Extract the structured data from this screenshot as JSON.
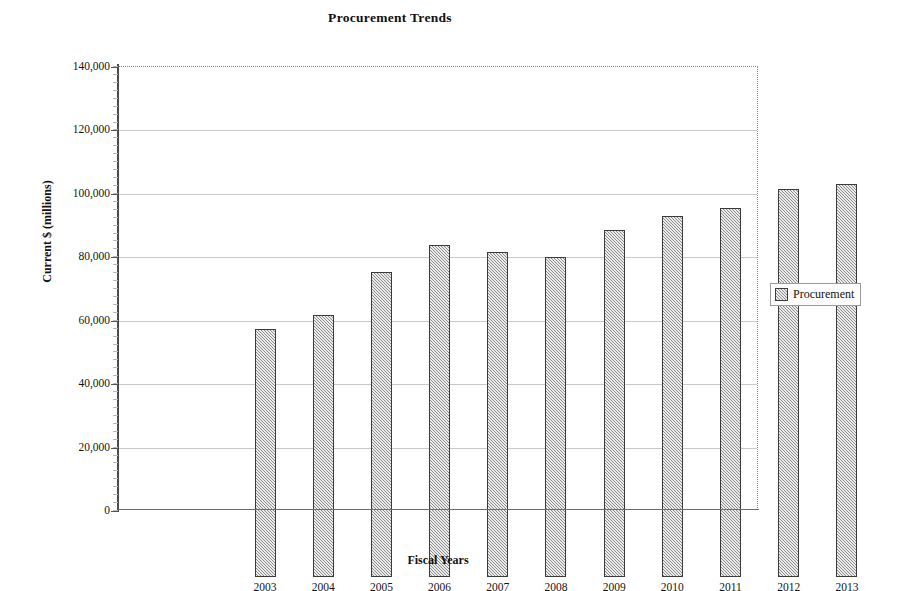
{
  "chart_data": {
    "type": "bar",
    "title": "Procurement Trends",
    "xlabel": "Fiscal Years",
    "ylabel": "Current $ (millions)",
    "categories": [
      "2003",
      "2004",
      "2005",
      "2006",
      "2007",
      "2008",
      "2009",
      "2010",
      "2011",
      "2012",
      "2013"
    ],
    "series": [
      {
        "name": "Procurement",
        "values": [
          78300,
          82700,
          96200,
          104800,
          102500,
          100800,
          109500,
          113700,
          116500,
          122400,
          123900
        ]
      }
    ],
    "ylim": [
      0,
      140000
    ],
    "ytick_step": 20000,
    "ytick_labels": [
      "0",
      "20,000",
      "40,000",
      "60,000",
      "80,000",
      "100,000",
      "120,000",
      "140,000"
    ],
    "ytick_values": [
      0,
      20000,
      40000,
      60000,
      80000,
      100000,
      120000,
      140000
    ],
    "grid": "horizontal",
    "legend_position": "right",
    "legend_entries": [
      "Procurement"
    ],
    "bar_fill_color": "#a6a6a6",
    "bar_border_color": "#3a3a3a",
    "gridline_color": "#c9c9c9"
  }
}
